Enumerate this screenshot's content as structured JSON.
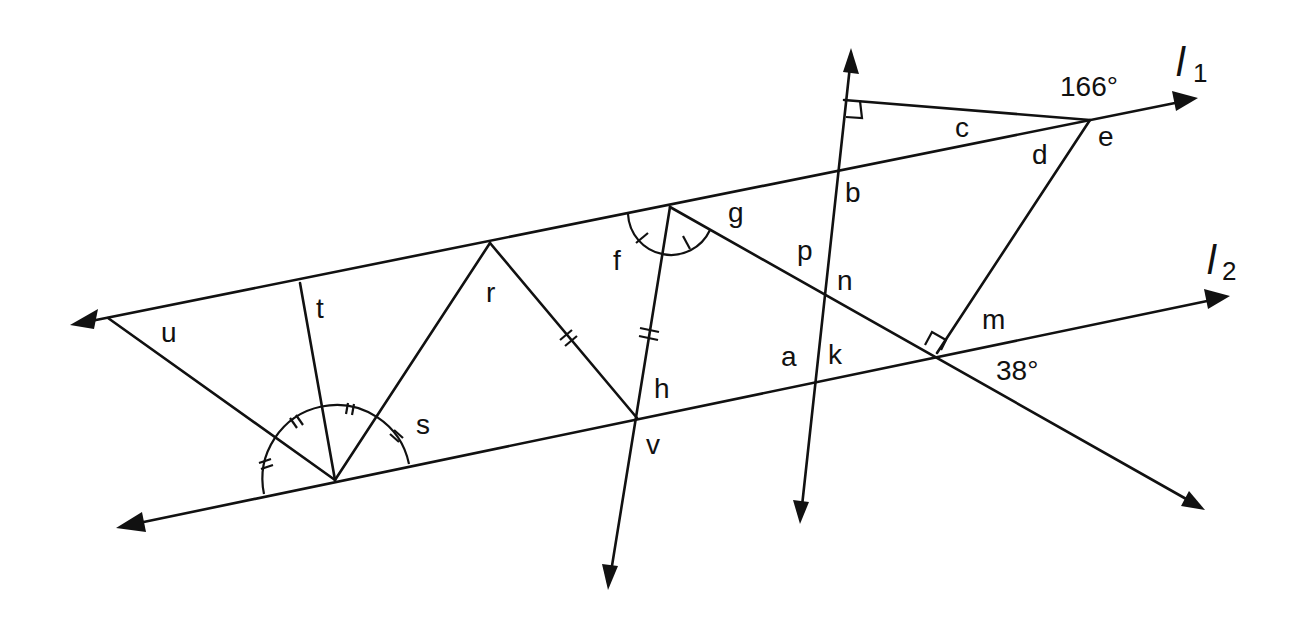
{
  "diagram": {
    "type": "geometry-angles",
    "lines": {
      "l1": {
        "name": "l",
        "subscript": "1"
      },
      "l2": {
        "name": "l",
        "subscript": "2"
      }
    },
    "given_angles": {
      "top_right": "166°",
      "bottom_right": "38°"
    },
    "angle_labels": {
      "a": "a",
      "b": "b",
      "c": "c",
      "d": "d",
      "e": "e",
      "f": "f",
      "g": "g",
      "h": "h",
      "k": "k",
      "m": "m",
      "n": "n",
      "p": "p",
      "r": "r",
      "s": "s",
      "t": "t",
      "u": "u",
      "v": "v"
    },
    "markings": {
      "right_angles": [
        "transversal-top",
        "l2-diagonal-intersection"
      ],
      "equal_arcs_double_tick": 4,
      "equal_arcs_single_tick": 2,
      "equal_segments_double_tick": 2
    },
    "colors": {
      "stroke": "#111111",
      "background": "#ffffff"
    }
  }
}
